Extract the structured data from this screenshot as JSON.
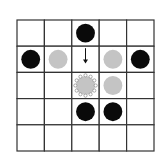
{
  "board": {
    "rows": 5,
    "cols": 5,
    "line_color": "#333333",
    "pieces": [
      {
        "row": 0,
        "col": 2,
        "type": "black"
      },
      {
        "row": 1,
        "col": 0,
        "type": "black"
      },
      {
        "row": 1,
        "col": 1,
        "type": "gray"
      },
      {
        "row": 1,
        "col": 3,
        "type": "gray"
      },
      {
        "row": 1,
        "col": 4,
        "type": "black"
      },
      {
        "row": 2,
        "col": 2,
        "type": "gray-highlighted"
      },
      {
        "row": 2,
        "col": 3,
        "type": "gray"
      },
      {
        "row": 3,
        "col": 2,
        "type": "black"
      },
      {
        "row": 3,
        "col": 3,
        "type": "black"
      }
    ],
    "arrow": {
      "row": 1,
      "col": 2,
      "direction": "down"
    },
    "colors": {
      "black": "#0a0a0a",
      "gray": "#c4c4c4",
      "highlight_dots": "#888888"
    }
  }
}
